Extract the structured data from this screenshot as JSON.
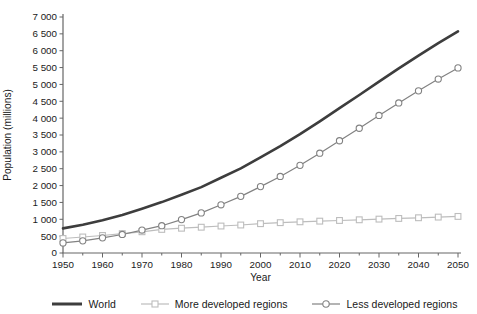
{
  "chart_data": {
    "type": "line",
    "title": "",
    "xlabel": "Year",
    "ylabel": "Population (millions)",
    "xlim": [
      1950,
      2050
    ],
    "ylim": [
      0,
      7000
    ],
    "y_tick_step": 500,
    "x_major_tick_step": 10,
    "x_minor_tick_step": 5,
    "grid": false,
    "legend_position": "bottom",
    "axis_color": "#666666",
    "tick_label_color": "#1a1a1a",
    "x": [
      1950,
      1955,
      1960,
      1965,
      1970,
      1975,
      1980,
      1985,
      1990,
      1995,
      2000,
      2005,
      2010,
      2015,
      2020,
      2025,
      2030,
      2035,
      2040,
      2045,
      2050
    ],
    "x_tick_labels": [
      "1950",
      "1960",
      "1970",
      "1980",
      "1990",
      "2000",
      "2010",
      "2020",
      "2030",
      "2040",
      "2050"
    ],
    "y_tick_labels": [
      "0",
      "500",
      "1 000",
      "1 500",
      "2 000",
      "2 500",
      "3 000",
      "3 500",
      "4 000",
      "4 500",
      "5 000",
      "5 500",
      "6 000",
      "6 500",
      "7 000"
    ],
    "series": [
      {
        "name": "World",
        "color": "#3d3d3d",
        "marker": "none",
        "line_width": 2.6,
        "values": [
          730,
          835,
          970,
          1125,
          1310,
          1510,
          1725,
          1955,
          2230,
          2510,
          2840,
          3170,
          3525,
          3905,
          4295,
          4685,
          5085,
          5475,
          5855,
          6225,
          6575
        ]
      },
      {
        "name": "More developed regions",
        "color": "#bdbdbd",
        "marker": "square",
        "line_width": 1.2,
        "values": [
          430,
          475,
          520,
          575,
          630,
          700,
          735,
          765,
          800,
          830,
          870,
          900,
          925,
          945,
          965,
          985,
          1005,
          1025,
          1045,
          1065,
          1085
        ]
      },
      {
        "name": "Less developed regions",
        "color": "#828282",
        "marker": "circle",
        "line_width": 1.2,
        "values": [
          300,
          360,
          450,
          550,
          680,
          810,
          990,
          1190,
          1430,
          1680,
          1970,
          2270,
          2600,
          2960,
          3330,
          3700,
          4080,
          4450,
          4810,
          5160,
          5490
        ]
      }
    ]
  }
}
